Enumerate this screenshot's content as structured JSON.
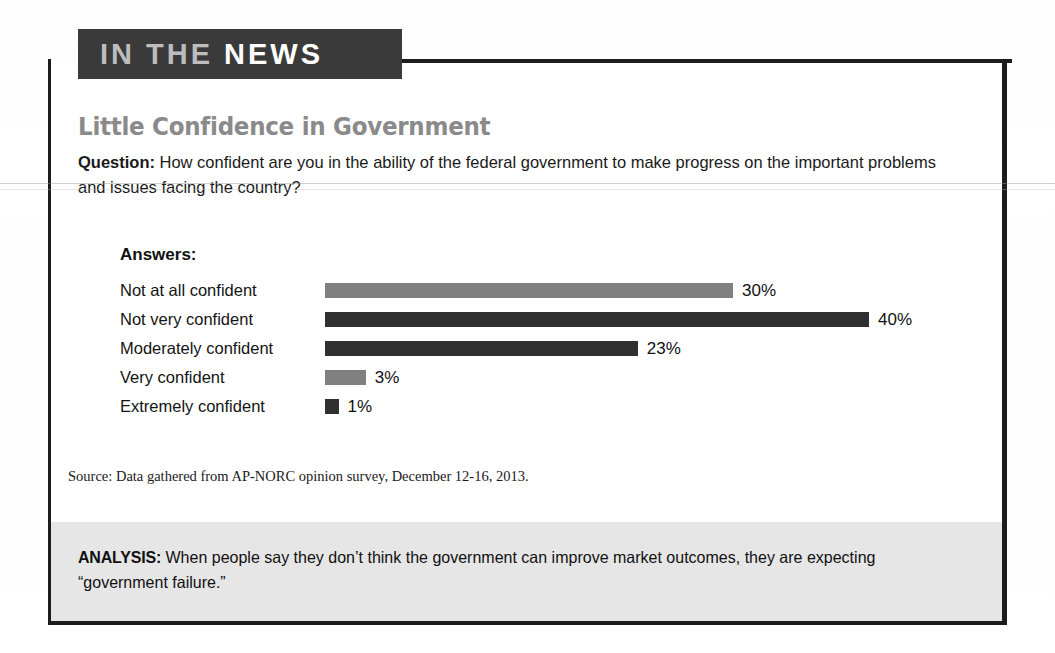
{
  "banner": {
    "word_light": "IN THE",
    "word_bright": "NEWS"
  },
  "title": "Little Confidence in Government",
  "question": {
    "label": "Question:",
    "text": " How confident are you in the ability of the federal government to make progress on the important problems and issues facing the country?"
  },
  "answers_label": "Answers:",
  "source": "Source: Data gathered from AP-NORC opinion survey, December 12-16, 2013.",
  "analysis": {
    "label": "ANALYSIS:",
    "text": " When people say they don’t think the government can improve market outcomes, they are expecting “government failure.”"
  },
  "colors": {
    "bar_light": "#808080",
    "bar_dark": "#303030",
    "banner_bg": "#3a3a3a",
    "title_gray": "#8a8a8a",
    "band_gray": "#e6e6e6",
    "border": "#1c1c1c"
  },
  "chart_data": {
    "type": "bar",
    "title": "Little Confidence in Government",
    "xlabel": "",
    "ylabel": "",
    "orientation": "horizontal",
    "categories": [
      "Not at all confident",
      "Not very confident",
      "Moderately confident",
      "Very confident",
      "Extremely confident"
    ],
    "values": [
      30,
      40,
      23,
      3,
      1
    ],
    "value_labels": [
      "30%",
      "40%",
      "23%",
      "3%",
      "1%"
    ],
    "bar_colors": [
      "#808080",
      "#303030",
      "#303030",
      "#808080",
      "#303030"
    ],
    "bar_shades": [
      "light",
      "dark",
      "dark",
      "light",
      "dark"
    ],
    "xlim": [
      0,
      40
    ],
    "grid": false,
    "legend": false,
    "units": "percent"
  }
}
